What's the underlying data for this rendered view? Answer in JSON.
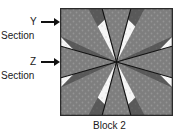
{
  "figure": {
    "caption": "Block 2",
    "annotations": [
      {
        "letter": "Y",
        "word": "Section",
        "arrow": "right-arrow-icon"
      },
      {
        "letter": "Z",
        "word": "Section",
        "arrow": "right-arrow-icon"
      }
    ]
  },
  "labels": {
    "y_letter": "Y",
    "y_section": "Section",
    "z_letter": "Z",
    "z_section": "Section",
    "block_caption": "Block 2"
  },
  "colors": {
    "outline": "#111111",
    "dark_fabric": "#5a5a5a",
    "medium_fabric": "#7d7d7d",
    "light_fabric": "#f2f2f2",
    "near_white": "#fafafa",
    "border": "#2b2b2b",
    "text": "#1a1a1a",
    "background": "#ffffff"
  },
  "block": {
    "name": "eight-pointed-star-quilt-block",
    "width": 113,
    "height": 108,
    "star_points": 8,
    "pieces": [
      {
        "id": "center-star-point-n",
        "fabric": "medium"
      },
      {
        "id": "center-star-point-ne",
        "fabric": "medium"
      },
      {
        "id": "center-star-point-e",
        "fabric": "medium"
      },
      {
        "id": "center-star-point-se",
        "fabric": "medium"
      },
      {
        "id": "center-star-point-s",
        "fabric": "medium"
      },
      {
        "id": "center-star-point-sw",
        "fabric": "medium"
      },
      {
        "id": "center-star-point-w",
        "fabric": "medium"
      },
      {
        "id": "center-star-point-nw",
        "fabric": "medium"
      },
      {
        "id": "corner-chevron-nw",
        "fabric": "dark"
      },
      {
        "id": "corner-chevron-ne",
        "fabric": "dark"
      },
      {
        "id": "corner-chevron-sw",
        "fabric": "dark"
      },
      {
        "id": "corner-chevron-se",
        "fabric": "dark"
      },
      {
        "id": "background-triangle-n",
        "fabric": "light"
      },
      {
        "id": "background-triangle-e",
        "fabric": "light"
      },
      {
        "id": "background-triangle-s",
        "fabric": "light"
      },
      {
        "id": "background-triangle-w",
        "fabric": "light"
      }
    ]
  }
}
